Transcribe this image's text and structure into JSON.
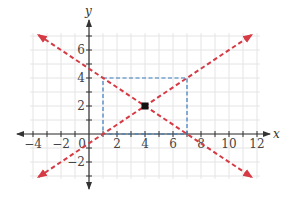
{
  "chart_data": {
    "type": "line",
    "title": "",
    "xlabel": "x",
    "ylabel": "y",
    "xlim": [
      -4.2,
      12.2
    ],
    "ylim": [
      -3.2,
      7.2
    ],
    "grid": true,
    "x_ticks": [
      -4,
      -2,
      0,
      2,
      4,
      6,
      8,
      10,
      12
    ],
    "x_tick_labels": [
      "−4",
      "−2",
      "0",
      "2",
      "4",
      "6",
      "8",
      "10",
      "12"
    ],
    "y_ticks": [
      -2,
      2,
      4,
      6
    ],
    "y_tick_labels": [
      "−2",
      "2",
      "4",
      "6"
    ],
    "series": [
      {
        "name": "line-positive-slope",
        "style": "dashed",
        "color": "#d63a44",
        "arrows": "both",
        "slope": 0.6667,
        "intercept": -0.6667,
        "points": [
          [
            1,
            0
          ],
          [
            4,
            2
          ],
          [
            7,
            4
          ]
        ],
        "x_range": [
          -3.6,
          11.6
        ]
      },
      {
        "name": "line-negative-slope",
        "style": "dashed",
        "color": "#d63a44",
        "arrows": "both",
        "slope": -0.6667,
        "intercept": 4.6667,
        "points": [
          [
            1,
            4
          ],
          [
            4,
            2
          ],
          [
            7,
            0
          ]
        ],
        "x_range": [
          -3.6,
          11.6
        ]
      }
    ],
    "rectangle": {
      "style": "dashed",
      "color": "#3a7cc0",
      "x": [
        1,
        7
      ],
      "y": [
        0,
        4
      ]
    },
    "highlight_point": {
      "x": 4,
      "y": 2,
      "color": "#111111",
      "marker": "square"
    }
  },
  "colors": {
    "grid": "#e4e4e4",
    "axis": "#333333",
    "line": "#d63a44",
    "rect": "#3a7cc0",
    "point": "#111111"
  }
}
